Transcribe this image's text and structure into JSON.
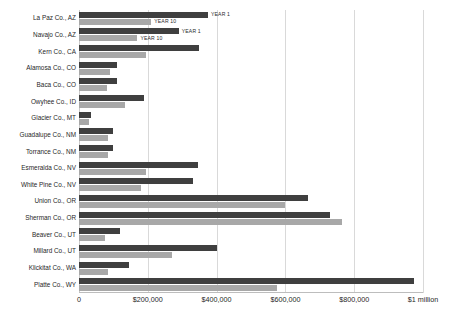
{
  "chart_data": {
    "type": "bar",
    "orientation": "horizontal",
    "title": "",
    "subtitle": "",
    "xlabel": "",
    "ylabel": "",
    "xlim": [
      0,
      1000000
    ],
    "grid": true,
    "grid_axis": "x",
    "legend_position": "none",
    "legend_as_annotation": true,
    "xticks": [
      {
        "value": 0,
        "label": "0"
      },
      {
        "value": 200000,
        "label": "$200,000"
      },
      {
        "value": 400000,
        "label": "$400,000"
      },
      {
        "value": 600000,
        "label": "$600,000"
      },
      {
        "value": 800000,
        "label": "$800,000"
      },
      {
        "value": 1000000,
        "label": "$1 million"
      }
    ],
    "categories": [
      "La Paz Co., AZ",
      "Navajo Co., AZ",
      "Kern Co., CA",
      "Alamosa Co., CO",
      "Baca Co., CO",
      "Owyhee Co., ID",
      "Glacier  Co., MT",
      "Guadalupe Co., NM",
      "Torrance Co., NM",
      "Esmeralda Co., NV",
      "White Pine Co., NV",
      "Union Co., OR",
      "Sherman Co., OR",
      "Beaver Co., UT",
      "Millard  Co., UT",
      "Klickitat Co., WA",
      "Platte Co., WY"
    ],
    "series": [
      {
        "name": "YEAR 1",
        "color": "#3f3f3f",
        "values": [
          375000,
          290000,
          350000,
          110000,
          110000,
          190000,
          35000,
          100000,
          100000,
          345000,
          330000,
          665000,
          730000,
          120000,
          400000,
          145000,
          975000
        ]
      },
      {
        "name": "YEAR 10",
        "color": "#a8a8a8",
        "values": [
          210000,
          170000,
          195000,
          90000,
          80000,
          135000,
          30000,
          85000,
          85000,
          195000,
          180000,
          600000,
          765000,
          75000,
          270000,
          85000,
          575000
        ]
      }
    ],
    "annotations": [
      {
        "text": "YEAR 1",
        "series": "YEAR 1",
        "category": "La Paz Co., AZ"
      },
      {
        "text": "YEAR 10",
        "series": "YEAR 10",
        "category": "La Paz Co., AZ"
      },
      {
        "text": "YEAR 1",
        "series": "YEAR 1",
        "category": "Navajo Co., AZ"
      },
      {
        "text": "YEAR 10",
        "series": "YEAR 10",
        "category": "Navajo Co., AZ"
      }
    ]
  },
  "colors": {
    "year1": "#3f3f3f",
    "year10": "#a8a8a8",
    "grid": "#d9d9d9",
    "background": "#ffffff",
    "text": "#1f1f1f"
  }
}
